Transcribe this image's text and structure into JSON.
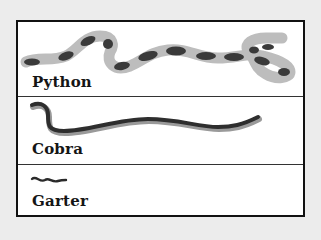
{
  "rows": [
    {
      "label": "Python",
      "illustration": "python-snake",
      "pattern": "banded",
      "body_color": "#bdbdbd",
      "band_color": "#3a3a3a"
    },
    {
      "label": "Cobra",
      "illustration": "cobra-snake",
      "body_color": "#2e2e2e",
      "belly_color": "#9a9a9a"
    },
    {
      "label": "Garter",
      "illustration": "garter-snake",
      "body_color": "#2a2a2a"
    }
  ],
  "colors": {
    "background": "#ececec",
    "panel": "#ffffff",
    "border": "#111111",
    "text": "#151515"
  }
}
